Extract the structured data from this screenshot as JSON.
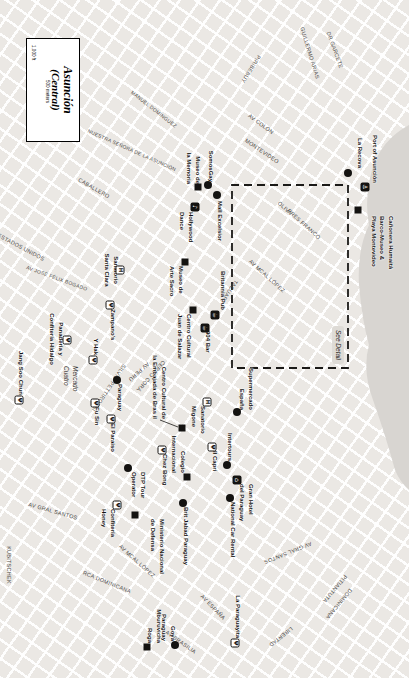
{
  "map": {
    "title": {
      "line1": "Asunción",
      "line2": "(Central)"
    },
    "scale": {
      "feet": "1,000 ft",
      "meters": "500 meters"
    },
    "inset_label": "See Detail",
    "colors": {
      "land": "#ebe8e4",
      "water": "#d8d5d1",
      "marker": "#141311",
      "street_text": "#4c4a47"
    },
    "icon_legend": {
      "anchor-icon": "⚓",
      "cup-icon": "☕",
      "music-icon": "♪",
      "hotel-icon": "⌂",
      "fork-icon": "Ψ",
      "hospital-icon": "H"
    },
    "places": [
      {
        "lines": [
          "Mercado",
          "Cuatro"
        ],
        "x": 366,
        "y": 330
      }
    ],
    "streets": [
      {
        "t": "GUILLERMO ARIAS",
        "x": 53,
        "y": 99,
        "a": -17
      },
      {
        "t": "DR GARCETE",
        "x": 50,
        "y": 74,
        "a": -20
      },
      {
        "t": "PIRIBEBUY",
        "x": 69,
        "y": 158,
        "a": 32
      },
      {
        "t": "AV COLÓN",
        "x": 124,
        "y": 148,
        "a": -53
      },
      {
        "t": "MONTEVIDEO",
        "x": 151,
        "y": 147,
        "a": -56
      },
      {
        "t": "NUESTRA SEÑORA DE LA ASUNCIÓN",
        "x": 150,
        "y": 277,
        "a": -66,
        "s": 5
      },
      {
        "t": "CABALLERO",
        "x": 188,
        "y": 315,
        "a": -60
      },
      {
        "t": "MANUEL DOMÍNGUEZ",
        "x": 109,
        "y": 255,
        "a": -52,
        "s": 5
      },
      {
        "t": "OLIVA",
        "x": 208,
        "y": 124,
        "a": -48
      },
      {
        "t": "PRES FRANCO",
        "x": 224,
        "y": 105,
        "a": -48
      },
      {
        "t": "AV MCAL LÓPEZ",
        "x": 276,
        "y": 142,
        "a": -48
      },
      {
        "t": "TACUARY",
        "x": 292,
        "y": 180,
        "a": 34
      },
      {
        "t": "ESTADOS UNIDOS",
        "x": 247,
        "y": 388,
        "a": -62
      },
      {
        "t": "AV JOSÉ FÉLIX BOGADO",
        "x": 278,
        "y": 352,
        "a": -70,
        "s": 5
      },
      {
        "t": "CERRO CORÁ",
        "x": 376,
        "y": 258,
        "a": 42
      },
      {
        "t": "AV PERÚ",
        "x": 372,
        "y": 270,
        "a": 48
      },
      {
        "t": "SILVIO PETTIROSSI",
        "x": 388,
        "y": 300,
        "a": 34
      },
      {
        "t": "AV GRAL SANTOS",
        "x": 511,
        "y": 356,
        "a": -74
      },
      {
        "t": "AV GRAL SANTOS",
        "x": 553,
        "y": 121,
        "a": 68
      },
      {
        "t": "RCA DOMINICANA",
        "x": 582,
        "y": 302,
        "a": -68
      },
      {
        "t": "AV MCAL LÓPEZ",
        "x": 561,
        "y": 272,
        "a": -48
      },
      {
        "t": "AV ESPAÑA",
        "x": 607,
        "y": 196,
        "a": -44
      },
      {
        "t": "AV BRASILIA",
        "x": 642,
        "y": 228,
        "a": -55
      },
      {
        "t": "PITIANTUTA",
        "x": 589,
        "y": 74,
        "a": 40
      },
      {
        "t": "DOMINICANA",
        "x": 604,
        "y": 70,
        "a": 40
      },
      {
        "t": "LIBERTAD",
        "x": 637,
        "y": 128,
        "a": 52
      },
      {
        "t": "KUBITSCHEK",
        "x": 565,
        "y": 400,
        "a": 0
      }
    ],
    "markers": [
      {
        "shape": "circle",
        "x": 173,
        "y": 61,
        "label": {
          "lines": [
            "La Recova"
          ],
          "x": 118,
          "y": 45,
          "w": 50,
          "align": "right"
        }
      },
      {
        "shape": "icon-filled",
        "glyph": "⚓",
        "icon": "anchor-icon",
        "x": 187,
        "y": 44,
        "label": {
          "lines": [
            "Port of Asunción"
          ],
          "x": 131,
          "y": 30,
          "w": 52,
          "align": "right"
        }
      },
      {
        "shape": "square",
        "x": 210,
        "y": 51,
        "label": {
          "lines": [
            "Cañonera Humaitá",
            "Barco-Museo &",
            "Playa Montevideo"
          ],
          "x": 216,
          "y": 14,
          "w": 70,
          "align": "left"
        }
      },
      {
        "shape": "square",
        "x": 187,
        "y": 211,
        "label": {
          "lines": [
            "Museo de",
            "la Memoria"
          ],
          "x": 146,
          "y": 207,
          "w": 38,
          "align": "right"
        }
      },
      {
        "shape": "circle",
        "x": 185,
        "y": 201,
        "label": {
          "lines": [
            "SomosGay"
          ],
          "x": 146,
          "y": 194,
          "w": 36,
          "align": "right"
        }
      },
      {
        "shape": "circle",
        "x": 195,
        "y": 192,
        "label": {
          "lines": [
            "Mall Excelsior"
          ],
          "x": 201,
          "y": 185,
          "w": 52,
          "align": "left"
        }
      },
      {
        "shape": "icon-filled",
        "glyph": "♪",
        "icon": "music-icon",
        "x": 207,
        "y": 214,
        "label": {
          "lines": [
            "Hollywood",
            "Dance"
          ],
          "x": 212,
          "y": 214,
          "w": 40,
          "align": "left"
        }
      },
      {
        "shape": "square",
        "x": 262,
        "y": 224,
        "label": {
          "lines": [
            "Museo de",
            "Arte Sacro"
          ],
          "x": 266,
          "y": 224,
          "w": 40,
          "align": "left"
        }
      },
      {
        "shape": "icon-filled",
        "glyph": "☕",
        "icon": "cup-icon",
        "x": 315,
        "y": 194,
        "label": {
          "lines": [
            "Britannia Pub"
          ],
          "x": 264,
          "y": 182,
          "w": 46,
          "align": "right"
        }
      },
      {
        "shape": "icon-filled",
        "glyph": "☕",
        "icon": "cup-icon",
        "x": 328,
        "y": 204,
        "label": {
          "lines": [
            "904 Bar"
          ],
          "x": 331,
          "y": 197,
          "w": 30,
          "align": "left"
        }
      },
      {
        "shape": "square",
        "x": 310,
        "y": 216,
        "label": {
          "lines": [
            "Centro Cultural",
            "Juan de Salazar"
          ],
          "x": 314,
          "y": 216,
          "w": 56,
          "align": "left"
        }
      },
      {
        "shape": "square",
        "x": 428,
        "y": 227,
        "label": {
          "lines": [
            "Centro Cultural de",
            "la Embajada de Bras il"
          ],
          "x": 352,
          "y": 241,
          "w": 67,
          "align": "right"
        }
      },
      {
        "shape": "icon-outline",
        "glyph": "H",
        "icon": "hospital-icon",
        "x": 270,
        "y": 289,
        "label": {
          "lines": [
            "Sanatorio",
            "Santa Clara"
          ],
          "x": 250,
          "y": 289,
          "w": 40,
          "align": "center"
        }
      },
      {
        "shape": "icon-outline",
        "glyph": "Ψ",
        "icon": "fork-icon",
        "x": 305,
        "y": 299,
        "label": {
          "lines": [
            "Zampano's"
          ],
          "x": 309,
          "y": 292,
          "w": 38,
          "align": "left"
        }
      },
      {
        "shape": "icon-outline",
        "glyph": "Ψ",
        "icon": "fork-icon",
        "x": 360,
        "y": 316,
        "label": {
          "lines": [
            "Y Hak"
          ],
          "x": 332,
          "y": 309,
          "w": 23,
          "align": "right"
        }
      },
      {
        "shape": "icon-outline",
        "glyph": "Ψ",
        "icon": "fork-icon",
        "x": 403,
        "y": 314,
        "label": {
          "lines": [
            "Fu Sin"
          ],
          "x": 407,
          "y": 308,
          "w": 26,
          "align": "left"
        }
      },
      {
        "shape": "icon-outline",
        "glyph": "Ψ",
        "icon": "fork-icon",
        "x": 419,
        "y": 298,
        "label": {
          "lines": [
            "El Paraiso"
          ],
          "x": 423,
          "y": 292,
          "w": 36,
          "align": "left"
        }
      },
      {
        "shape": "icon-outline",
        "glyph": "Ψ",
        "icon": "fork-icon",
        "x": 400,
        "y": 390,
        "label": {
          "lines": [
            "Jang Soo Chun"
          ],
          "x": 345,
          "y": 384,
          "w": 50,
          "align": "right"
        }
      },
      {
        "shape": "icon-outline",
        "glyph": "Ψ",
        "icon": "fork-icon",
        "x": 340,
        "y": 342,
        "label": {
          "lines": [
            "Panadería y",
            "Confitería Hidalgo"
          ],
          "x": 306,
          "y": 344,
          "w": 66,
          "align": "center"
        }
      },
      {
        "shape": "circle",
        "x": 380,
        "y": 292,
        "label": {
          "lines": [
            "Paraguay"
          ],
          "x": 384,
          "y": 285,
          "w": 34,
          "align": "left"
        }
      },
      {
        "shape": "icon-outline",
        "glyph": "Ψ",
        "icon": "fork-icon",
        "x": 450,
        "y": 247,
        "label": {
          "lines": [
            "Chez Bong"
          ],
          "x": 454,
          "y": 240,
          "w": 38,
          "align": "left"
        }
      },
      {
        "shape": "icon-outline",
        "glyph": "H",
        "icon": "hospital-icon",
        "x": 402,
        "y": 202,
        "label": {
          "lines": [
            "Sanatorio",
            "Migone"
          ],
          "x": 406,
          "y": 202,
          "w": 36,
          "align": "left"
        }
      },
      {
        "shape": "circle",
        "x": 412,
        "y": 172,
        "label": {
          "lines": [
            "Supermercado",
            "España"
          ],
          "x": 358,
          "y": 154,
          "w": 52,
          "align": "right"
        }
      },
      {
        "shape": "icon-outline",
        "glyph": "Ψ",
        "icon": "fork-icon",
        "x": 447,
        "y": 197,
        "label": {
          "lines": [
            "Il Capri"
          ],
          "x": 451,
          "y": 190,
          "w": 28,
          "align": "left"
        }
      },
      {
        "shape": "circle",
        "x": 465,
        "y": 182,
        "label": {
          "lines": [
            "Intertours"
          ],
          "x": 418,
          "y": 175,
          "w": 43,
          "align": "right"
        }
      },
      {
        "shape": "circle",
        "x": 468,
        "y": 281,
        "label": {
          "lines": [
            "DTP Tour",
            "Operator"
          ],
          "x": 472,
          "y": 262,
          "w": 34,
          "align": "left"
        }
      },
      {
        "shape": "square",
        "x": 477,
        "y": 222,
        "label": {
          "lines": [
            "Colegio",
            "Internacional"
          ],
          "x": 426,
          "y": 222,
          "w": 47,
          "align": "right"
        }
      },
      {
        "shape": "icon-filled",
        "glyph": "⌂",
        "icon": "hotel-icon",
        "x": 480,
        "y": 172,
        "label": {
          "lines": [
            "Gran Hotel",
            "del Paraguay"
          ],
          "x": 484,
          "y": 154,
          "w": 46,
          "align": "left"
        }
      },
      {
        "shape": "circle",
        "x": 498,
        "y": 179,
        "label": {
          "lines": [
            "National Car Rental"
          ],
          "x": 502,
          "y": 172,
          "w": 68,
          "align": "left"
        }
      },
      {
        "shape": "circle",
        "x": 503,
        "y": 226,
        "label": {
          "lines": [
            "Brit Jabad Paraguay"
          ],
          "x": 507,
          "y": 219,
          "w": 68,
          "align": "left"
        }
      },
      {
        "shape": "icon-outline",
        "glyph": "Ψ",
        "icon": "fork-icon",
        "x": 505,
        "y": 292,
        "label": {
          "lines": [
            "Confitería",
            "Honey"
          ],
          "x": 509,
          "y": 292,
          "w": 38,
          "align": "left"
        }
      },
      {
        "shape": "square",
        "x": 515,
        "y": 274,
        "label": {
          "lines": [
            "Ministerio Nacional",
            "de Defensa"
          ],
          "x": 519,
          "y": 243,
          "w": 64,
          "align": "left"
        }
      },
      {
        "shape": "square",
        "x": 647,
        "y": 262,
        "label": {
          "lines": [
            "Mburuvicha",
            "Roga"
          ],
          "x": 600,
          "y": 246,
          "w": 43,
          "align": "right"
        }
      },
      {
        "shape": "circle",
        "x": 645,
        "y": 234,
        "label": {
          "lines": [
            "Goya",
            "Paraguay"
          ],
          "x": 599,
          "y": 232,
          "w": 42,
          "align": "right"
        }
      },
      {
        "shape": "icon-outline",
        "glyph": "Ψ",
        "icon": "fork-icon",
        "x": 643,
        "y": 174,
        "label": {
          "lines": [
            "La Paraguayita"
          ],
          "x": 586,
          "y": 167,
          "w": 52,
          "align": "right"
        }
      }
    ]
  }
}
